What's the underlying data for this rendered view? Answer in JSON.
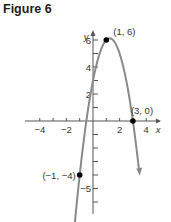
{
  "title": "Figure 6",
  "chart_data": {
    "type": "line",
    "title": "Figure 6",
    "xlabel": "x",
    "ylabel": "y",
    "function": "f(x) = -2x^2 + 5x + 3",
    "xlim": [
      -4.5,
      4.5
    ],
    "ylim": [
      -6.5,
      6.5
    ],
    "x_ticks": [
      -4,
      -3,
      -2,
      -1,
      1,
      2,
      3,
      4
    ],
    "x_tick_labels": [
      "-4",
      "-2",
      "2",
      "4"
    ],
    "x_tick_label_values": [
      -4,
      -2,
      2,
      4
    ],
    "y_ticks": [
      -6,
      -5,
      -4,
      -3,
      -2,
      -1,
      1,
      2,
      3,
      4,
      5,
      6
    ],
    "y_tick_labels": [
      "6",
      "4",
      "2",
      "-5"
    ],
    "y_tick_label_values": [
      6,
      4,
      2,
      -5
    ],
    "points": [
      {
        "x": -1,
        "y": -4,
        "label": "(−1, −4)"
      },
      {
        "x": 1,
        "y": 6,
        "label": "(1, 6)"
      },
      {
        "x": 3,
        "y": 0,
        "label": "(3, 0)"
      }
    ],
    "curve_color": "#8a8a8a",
    "point_color": "#000000",
    "grid": false
  }
}
